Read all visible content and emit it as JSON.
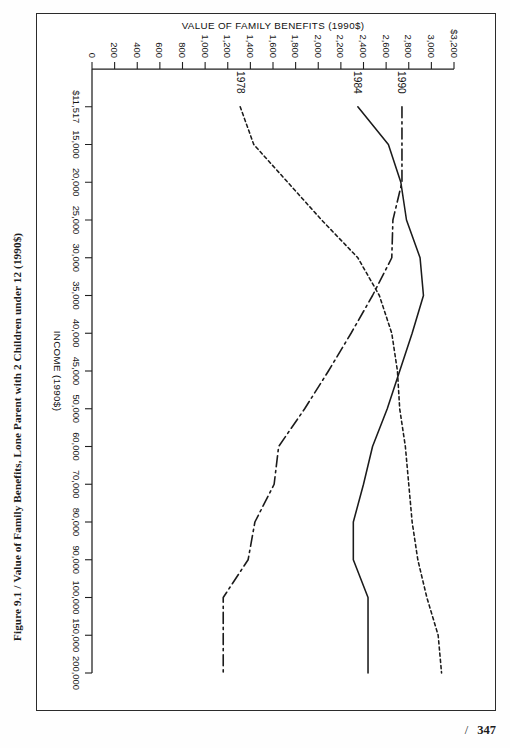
{
  "page": {
    "folio_number": "347",
    "folio_separator": "/"
  },
  "caption": {
    "figure_number": "Figure 9.1",
    "separator": "/",
    "title": "Value of Family Benefits, Lone Parent with 2 Children under 12 (1990$)"
  },
  "chart_data": {
    "type": "line",
    "title": "Value of Family Benefits, Lone Parent with 2 Children under 12 (1990$)",
    "xlabel": "INCOME (1990$)",
    "ylabel": "VALUE OF FAMILY BENEFITS (1990$)",
    "orientation": "rotated-90-clockwise-on-page",
    "grid": false,
    "legend": "inline-end-labels",
    "x_tick_labels": [
      "$11,517",
      "15,000",
      "20,000",
      "25,000",
      "30,000",
      "35,000",
      "40,000",
      "45,000",
      "50,000",
      "60,000",
      "70,000",
      "80,000",
      "90,000",
      "100,000",
      "150,000",
      "200,000"
    ],
    "x_tick_values": [
      11517,
      15000,
      20000,
      25000,
      30000,
      35000,
      40000,
      45000,
      50000,
      60000,
      70000,
      80000,
      90000,
      100000,
      150000,
      200000
    ],
    "x_axis_scale": "categorical-uneven (tick positions evenly spaced)",
    "y_tick_labels": [
      "$3,200",
      "3,000",
      "2,800",
      "2,600",
      "2,400",
      "2,200",
      "2,000",
      "1,800",
      "1,600",
      "1,400",
      "1,200",
      "1,000",
      "800",
      "600",
      "400",
      "200",
      "0"
    ],
    "y_tick_values": [
      3200,
      3000,
      2800,
      2600,
      2400,
      2200,
      2000,
      1800,
      1600,
      1400,
      1200,
      1000,
      800,
      600,
      400,
      200,
      0
    ],
    "ylim": [
      0,
      3200
    ],
    "series": [
      {
        "name": "1978",
        "label": "1978",
        "style": "dotted",
        "x": [
          11517,
          15000,
          20000,
          25000,
          30000,
          35000,
          40000,
          45000,
          50000,
          60000,
          70000,
          80000,
          90000,
          100000,
          150000,
          200000
        ],
        "values": [
          1310,
          1430,
          1730,
          2030,
          2350,
          2540,
          2650,
          2700,
          2720,
          2770,
          2800,
          2830,
          2880,
          2960,
          3060,
          3090
        ]
      },
      {
        "name": "1984",
        "label": "1984",
        "style": "solid",
        "x": [
          11517,
          15000,
          20000,
          25000,
          30000,
          35000,
          40000,
          45000,
          50000,
          60000,
          70000,
          80000,
          90000,
          100000,
          150000,
          200000
        ],
        "values": [
          2350,
          2620,
          2730,
          2780,
          2900,
          2930,
          2830,
          2720,
          2610,
          2480,
          2400,
          2310,
          2310,
          2440,
          2440,
          2440
        ]
      },
      {
        "name": "1990",
        "label": "1990",
        "style": "dash-dot",
        "x": [
          11517,
          15000,
          20000,
          25000,
          30000,
          35000,
          40000,
          45000,
          50000,
          60000,
          70000,
          80000,
          90000,
          100000,
          150000,
          200000
        ],
        "values": [
          2740,
          2740,
          2740,
          2660,
          2650,
          2480,
          2290,
          2090,
          1880,
          1650,
          1610,
          1440,
          1380,
          1160,
          1160,
          1160
        ]
      }
    ]
  },
  "colors": {
    "ink": "#1b1b1b",
    "frame": "#2b2b2b",
    "paper": "#ffffff"
  }
}
